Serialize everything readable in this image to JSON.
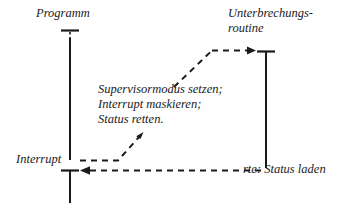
{
  "diagram": {
    "title_text": "Interrupt-Ablauf",
    "type": "sequence-timing-diagram",
    "stroke_color": "#1a1a1a",
    "background_color": "#ffffff",
    "lanes": [
      {
        "id": "programm",
        "label": "Programm",
        "x": 70,
        "top_tick_y": 30,
        "line_top_y": 38,
        "line_bottom_y": 160
      },
      {
        "id": "unterbrechungsroutine",
        "label_line1": "Unterbrechungs-",
        "label_line2": "routine",
        "x": 266,
        "top_tick_y": 51,
        "line_top_y": 51,
        "line_bottom_y": 168
      },
      {
        "id": "interrupt",
        "label": "Interrupt",
        "x": 70,
        "top_tick_y": 170,
        "line_top_y": 170,
        "line_bottom_y": 203
      }
    ],
    "notes": [
      "Supervisormodus setzen;",
      "Interrupt maskieren;",
      "Status retten."
    ],
    "return_label": "rte: Status laden",
    "arrows": [
      {
        "id": "entry-arrow-to-routine",
        "direction": "right",
        "style": "dashed",
        "points": "175,86 213,50 255,50"
      },
      {
        "id": "interrupt-trigger-arrow",
        "direction": "up-right",
        "style": "dashed",
        "points": "82,160 118,160 142,134"
      },
      {
        "id": "return-arrow-to-program",
        "direction": "left",
        "style": "dashed",
        "points": "265,170 82,170"
      }
    ]
  }
}
